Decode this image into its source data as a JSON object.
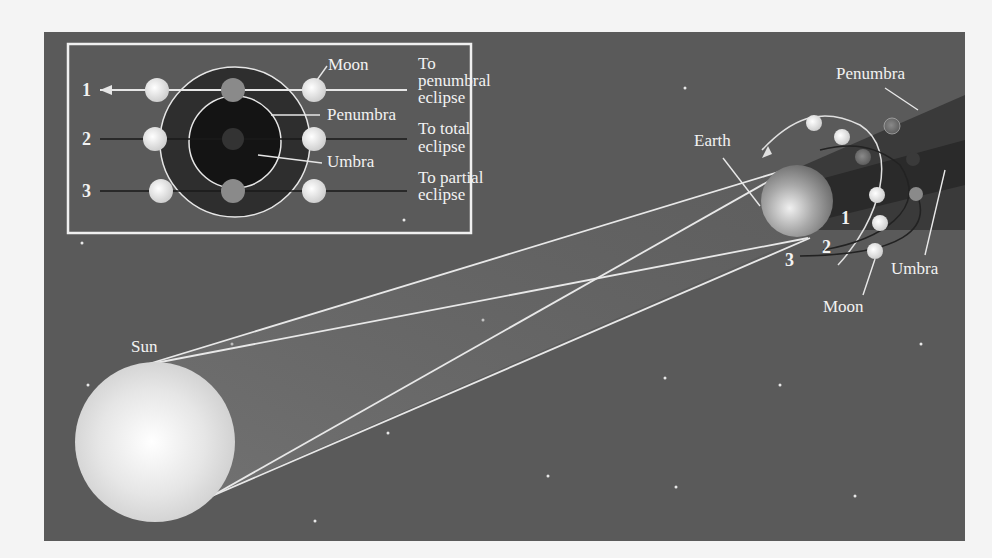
{
  "figure": {
    "background": "#5a5a5a",
    "labels": {
      "sun": "Sun",
      "earth": "Earth",
      "moon": "Moon",
      "penumbra": "Penumbra",
      "umbra": "Umbra",
      "path_numbers": [
        "1",
        "2",
        "3"
      ]
    },
    "inset": {
      "labels": {
        "moon": "Moon",
        "penumbra": "Penumbra",
        "umbra": "Umbra"
      },
      "rows": [
        {
          "number": "1",
          "line1": "To",
          "line2": "penumbral",
          "line3": "eclipse"
        },
        {
          "number": "2",
          "line1": "To total",
          "line2": "eclipse"
        },
        {
          "number": "3",
          "line1": "To partial",
          "line2": "eclipse"
        }
      ]
    }
  }
}
